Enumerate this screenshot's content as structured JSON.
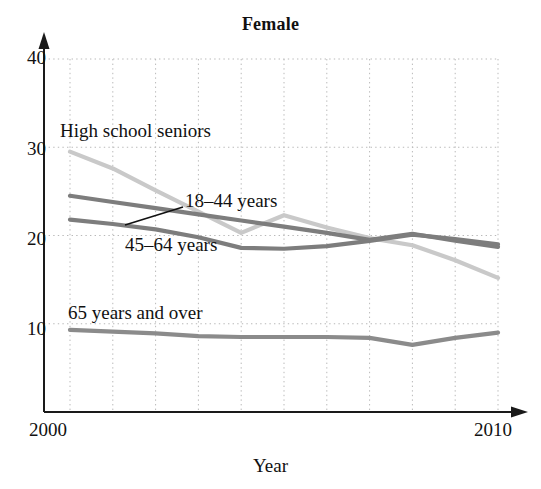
{
  "chart_data": {
    "type": "line",
    "title": "Female",
    "xlabel": "Year",
    "ylabel": "",
    "x": [
      2000,
      2001,
      2002,
      2003,
      2004,
      2005,
      2006,
      2007,
      2008,
      2009,
      2010
    ],
    "xlim": [
      2000,
      2010
    ],
    "ylim": [
      0,
      40
    ],
    "xtick_labels": [
      "2000",
      "2010"
    ],
    "ytick_labels": [
      "10",
      "20",
      "30",
      "40"
    ],
    "yticks": [
      10,
      20,
      30,
      40
    ],
    "grid": true,
    "grid_style": "dotted",
    "legend": "inline-annotations",
    "series": [
      {
        "name": "High school seniors",
        "color": "#c9c9c9",
        "values": [
          29.5,
          27.6,
          25.1,
          22.7,
          20.3,
          22.3,
          20.9,
          19.7,
          18.9,
          17.2,
          15.2
        ]
      },
      {
        "name": "18–44 years",
        "color": "#7d7d7d",
        "values": [
          24.5,
          23.8,
          23.1,
          22.4,
          21.7,
          21.0,
          20.3,
          19.5,
          20.2,
          19.4,
          18.7
        ]
      },
      {
        "name": "45–64 years",
        "color": "#7d7d7d",
        "values": [
          21.8,
          21.3,
          20.7,
          19.8,
          18.6,
          18.5,
          18.8,
          19.4,
          20.1,
          19.6,
          19.0
        ]
      },
      {
        "name": "65 years and over",
        "color": "#8b8b8b",
        "values": [
          9.3,
          9.1,
          8.9,
          8.6,
          8.5,
          8.5,
          8.5,
          8.4,
          7.6,
          8.4,
          9.0
        ]
      }
    ],
    "annotations": [
      {
        "text": "High school seniors",
        "x_px": 60,
        "y_px": 120
      },
      {
        "text": "18–44 years",
        "x_px": 185,
        "y_px": 190
      },
      {
        "text": "45–64 years",
        "x_px": 125,
        "y_px": 234
      },
      {
        "text": "65 years and over",
        "x_px": 68,
        "y_px": 302
      }
    ],
    "leader_lines": [
      {
        "from_x_px": 183,
        "from_y_px": 207,
        "to_x_px": 125,
        "to_y_px": 225
      }
    ]
  },
  "axis": {
    "y_labels": [
      {
        "text": "40",
        "y_px": 59
      },
      {
        "text": "30",
        "y_px": 150
      },
      {
        "text": "20",
        "y_px": 240
      },
      {
        "text": "10",
        "y_px": 330
      }
    ],
    "x_labels": [
      {
        "text": "2000",
        "x_px": 48
      },
      {
        "text": "2010",
        "x_px": 478
      }
    ],
    "x_title": "Year"
  },
  "colors": {
    "axis": "#1a1a1a",
    "grid": "#b9b9b9",
    "text": "#111111",
    "series_dark": "#7d7d7d",
    "series_light": "#c9c9c9",
    "series_mid": "#8b8b8b",
    "background": "#ffffff"
  }
}
